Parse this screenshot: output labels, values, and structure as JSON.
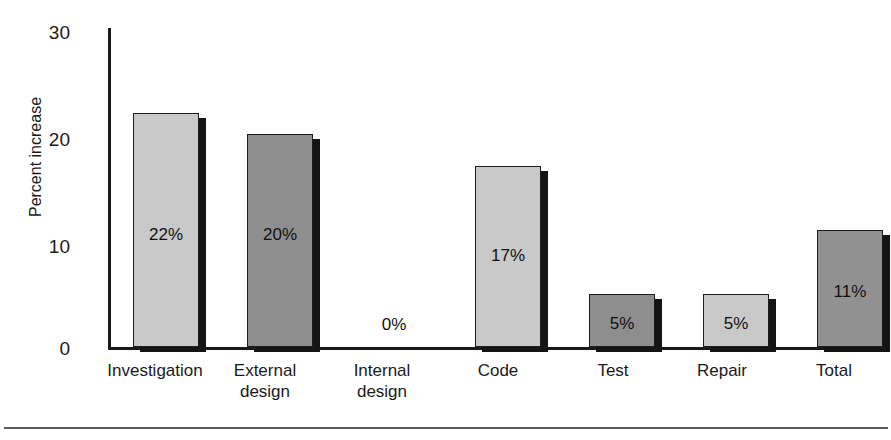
{
  "chart_data": {
    "type": "bar",
    "title": "",
    "xlabel": "",
    "ylabel": "Percent increase",
    "ylim": [
      0,
      30
    ],
    "yticks": [
      "0",
      "10",
      "20",
      "30"
    ],
    "grid": false,
    "legend": "none",
    "categories": [
      "Investigation",
      "External design",
      "Internal design",
      "Code",
      "Test",
      "Repair",
      "Total"
    ],
    "values": [
      22,
      20,
      0,
      17,
      5,
      5,
      11
    ],
    "data_labels": [
      "22%",
      "20%",
      "0%",
      "17%",
      "5%",
      "5%",
      "11%"
    ],
    "bars": [
      {
        "category": "Investigation",
        "label_lines": [
          "Investigation"
        ],
        "value": 22,
        "data_label": "22%",
        "fill": "#c9c9c9",
        "shade": "light"
      },
      {
        "category": "External design",
        "label_lines": [
          "External",
          "design"
        ],
        "value": 20,
        "data_label": "20%",
        "fill": "#8e8e8e",
        "shade": "dark"
      },
      {
        "category": "Internal design",
        "label_lines": [
          "Internal",
          "design"
        ],
        "value": 0,
        "data_label": "0%",
        "fill": "none",
        "shade": "none"
      },
      {
        "category": "Code",
        "label_lines": [
          "Code"
        ],
        "value": 17,
        "data_label": "17%",
        "fill": "#c9c9c9",
        "shade": "light"
      },
      {
        "category": "Test",
        "label_lines": [
          "Test"
        ],
        "value": 5,
        "data_label": "5%",
        "fill": "#8e8e8e",
        "shade": "dark"
      },
      {
        "category": "Repair",
        "label_lines": [
          "Repair"
        ],
        "value": 5,
        "data_label": "5%",
        "fill": "#c9c9c9",
        "shade": "light"
      },
      {
        "category": "Total",
        "label_lines": [
          "Total"
        ],
        "value": 11,
        "data_label": "11%",
        "fill": "#919191",
        "shade": "dark"
      }
    ],
    "colors": {
      "bar_light": "#c9c9c9",
      "bar_dark": "#8e8e8e",
      "bar_total": "#919191",
      "shadow": "#141414",
      "axis": "#1a1a1a",
      "text": "#1a1a1a",
      "background": "#ffffff",
      "rule": "#5c5c5c"
    }
  }
}
